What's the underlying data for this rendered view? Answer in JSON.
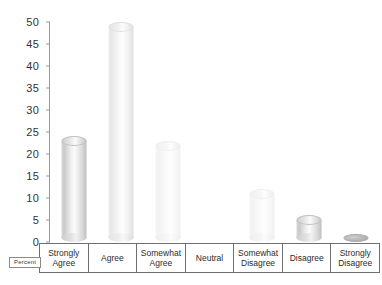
{
  "chart_data": {
    "type": "bar",
    "title": "",
    "subtitle": "",
    "xlabel": "",
    "ylabel": "Percent",
    "categories": [
      "Strongly Agree",
      "Agree",
      "Somewhat Agree",
      "Neutral",
      "Somewhat Disagree",
      "Disagree",
      "Strongly Disagree"
    ],
    "category_lines": [
      [
        "Strongly",
        "Agree"
      ],
      [
        "Agree"
      ],
      [
        "Somewhat",
        "Agree"
      ],
      [
        "Neutral"
      ],
      [
        "Somewhat",
        "Disagree"
      ],
      [
        "Disagree"
      ],
      [
        "Strongly",
        "Disagree"
      ]
    ],
    "values": [
      22,
      48,
      21,
      0,
      10,
      4,
      0.5
    ],
    "ylim": [
      0,
      50
    ],
    "ytick_step": 5,
    "yticks": [
      0,
      5,
      10,
      15,
      20,
      25,
      30,
      35,
      40,
      45,
      50
    ],
    "ytick_labels": [
      "0",
      "5",
      "10",
      "15",
      "20",
      "25",
      "30",
      "35",
      "40",
      "45",
      "50"
    ],
    "grid": false,
    "legend": "none",
    "bar_style": "3d-cylinder",
    "colors": {
      "background": "#ffffff",
      "bar_fill": "#e4e4e4",
      "bar_edge": "#c2c2c2",
      "axis": "#9a9a9a",
      "text": "#2b2b2b",
      "table_border": "#6f6f6f"
    }
  },
  "axis_title_box": {
    "label": "Percent"
  }
}
